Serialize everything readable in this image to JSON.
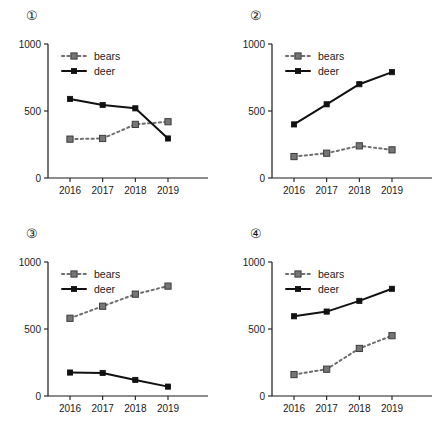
{
  "figure": {
    "background": "#ffffff",
    "colors": {
      "deer": "#111111",
      "bears": "#767676",
      "axis": "#1a1a1a"
    },
    "panel_count": 4
  },
  "chart_data": [
    {
      "type": "line",
      "title": "①",
      "xlabel": "",
      "ylabel": "",
      "categories": [
        "2016",
        "2017",
        "2018",
        "2019"
      ],
      "yticks": [
        "0",
        "500",
        "1000"
      ],
      "ytick_values": [
        0,
        500,
        1000
      ],
      "ylim": [
        0,
        1000
      ],
      "grid": false,
      "legend_position": "top-left",
      "series": [
        {
          "name": "bears",
          "values": [
            290,
            295,
            400,
            420
          ],
          "style": "dotted",
          "color": "#767676",
          "marker": "square"
        },
        {
          "name": "deer",
          "values": [
            590,
            545,
            520,
            295
          ],
          "style": "solid",
          "color": "#111111",
          "marker": "square"
        }
      ]
    },
    {
      "type": "line",
      "title": "②",
      "xlabel": "",
      "ylabel": "",
      "categories": [
        "2016",
        "2017",
        "2018",
        "2019"
      ],
      "yticks": [
        "0",
        "500",
        "1000"
      ],
      "ytick_values": [
        0,
        500,
        1000
      ],
      "ylim": [
        0,
        1000
      ],
      "grid": false,
      "legend_position": "top-left",
      "series": [
        {
          "name": "bears",
          "values": [
            160,
            185,
            240,
            210
          ],
          "style": "dotted",
          "color": "#767676",
          "marker": "square"
        },
        {
          "name": "deer",
          "values": [
            400,
            550,
            700,
            790
          ],
          "style": "solid",
          "color": "#111111",
          "marker": "square"
        }
      ]
    },
    {
      "type": "line",
      "title": "③",
      "xlabel": "",
      "ylabel": "",
      "categories": [
        "2016",
        "2017",
        "2018",
        "2019"
      ],
      "yticks": [
        "0",
        "500",
        "1000"
      ],
      "ytick_values": [
        0,
        500,
        1000
      ],
      "ylim": [
        0,
        1000
      ],
      "grid": false,
      "legend_position": "top-left",
      "series": [
        {
          "name": "bears",
          "values": [
            580,
            670,
            760,
            820
          ],
          "style": "dotted",
          "color": "#767676",
          "marker": "square"
        },
        {
          "name": "deer",
          "values": [
            175,
            172,
            120,
            70
          ],
          "style": "solid",
          "color": "#111111",
          "marker": "square"
        }
      ]
    },
    {
      "type": "line",
      "title": "④",
      "xlabel": "",
      "ylabel": "",
      "categories": [
        "2016",
        "2017",
        "2018",
        "2019"
      ],
      "yticks": [
        "0",
        "500",
        "1000"
      ],
      "ytick_values": [
        0,
        500,
        1000
      ],
      "ylim": [
        0,
        1000
      ],
      "grid": false,
      "legend_position": "top-left",
      "series": [
        {
          "name": "bears",
          "values": [
            160,
            200,
            355,
            450
          ],
          "style": "dotted",
          "color": "#767676",
          "marker": "square"
        },
        {
          "name": "deer",
          "values": [
            595,
            630,
            710,
            800
          ],
          "style": "solid",
          "color": "#111111",
          "marker": "square"
        }
      ]
    }
  ]
}
